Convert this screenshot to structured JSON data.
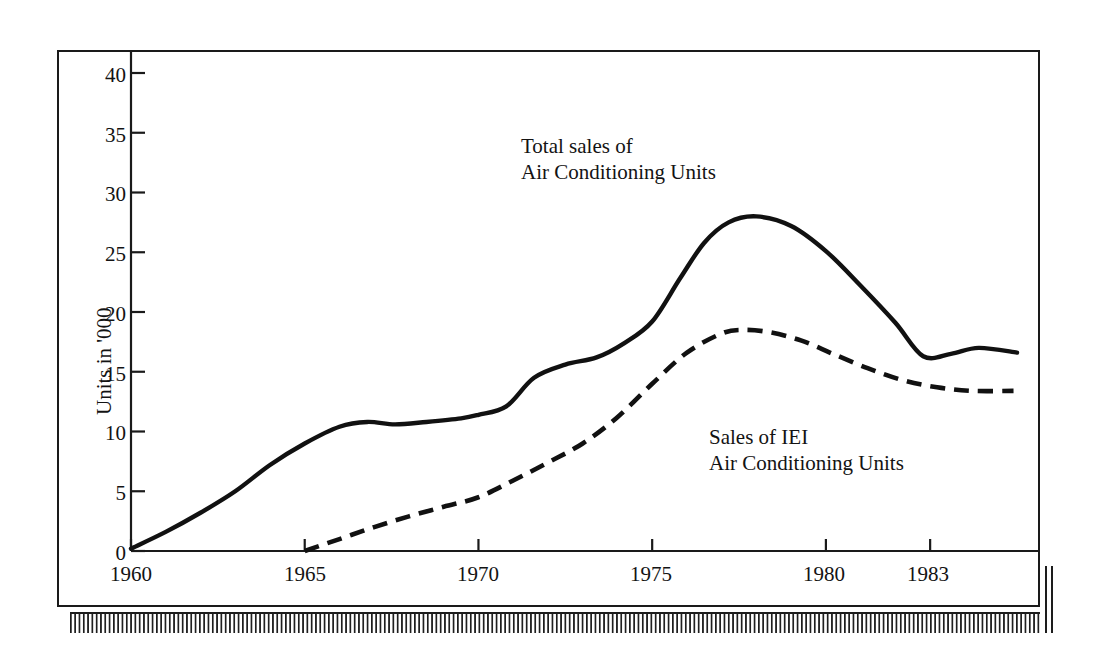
{
  "figure": {
    "background_color": "#ffffff",
    "ink_color": "#131313"
  },
  "axis": {
    "y_title": "Units in '000",
    "y_ticks": [
      "0",
      "5",
      "10",
      "15",
      "20",
      "25",
      "30",
      "35",
      "40"
    ],
    "y_tick_values": [
      0,
      5,
      10,
      15,
      20,
      25,
      30,
      35,
      40
    ],
    "x_ticks": [
      "1960",
      "1965",
      "1970",
      "1975",
      "1980",
      "1983"
    ],
    "x_tick_values": [
      1960,
      1965,
      1970,
      1975,
      1980,
      1983
    ]
  },
  "annotations": {
    "total_sales": {
      "line1": "Total sales of",
      "line2": "Air Conditioning Units"
    },
    "iei_sales": {
      "line1": "Sales of IEI",
      "line2": "Air Conditioning Units"
    }
  },
  "chart_data": {
    "type": "line",
    "title": "",
    "subtitle": "",
    "xlabel": "",
    "ylabel": "Units in '000",
    "xlim": [
      1960,
      1985.5
    ],
    "ylim": [
      0,
      42
    ],
    "grid": false,
    "legend_position": "inline-annotation",
    "x_tick_labels": [
      "1960",
      "1965",
      "1970",
      "1975",
      "1980",
      "1983"
    ],
    "y_tick_labels": [
      "0",
      "5",
      "10",
      "15",
      "20",
      "25",
      "30",
      "35",
      "40"
    ],
    "series": [
      {
        "name": "Total sales of Air Conditioning Units",
        "style": "solid",
        "color": "#111111",
        "x": [
          1960,
          1961,
          1962,
          1963,
          1964,
          1965,
          1966,
          1966.8,
          1967.6,
          1968.5,
          1969.5,
          1970,
          1970.8,
          1971.6,
          1972.5,
          1973.4,
          1974.2,
          1975,
          1975.8,
          1976.5,
          1977.2,
          1978,
          1979,
          1980,
          1981,
          1982,
          1982.8,
          1983.6,
          1984.4,
          1985.5
        ],
        "y": [
          0.2,
          1.6,
          3.2,
          5.0,
          7.2,
          9.0,
          10.4,
          10.8,
          10.6,
          10.8,
          11.1,
          11.4,
          12.1,
          14.5,
          15.6,
          16.2,
          17.4,
          19.2,
          22.8,
          25.8,
          27.5,
          28.0,
          27.2,
          25.1,
          22.2,
          19.1,
          16.3,
          16.5,
          17.0,
          16.6
        ]
      },
      {
        "name": "Sales of IEI Air Conditioning Units",
        "style": "dashed",
        "color": "#111111",
        "x": [
          1965,
          1966,
          1967,
          1968,
          1969,
          1970,
          1971,
          1972,
          1973,
          1974,
          1975,
          1976,
          1977,
          1977.6,
          1978.4,
          1979.3,
          1980.2,
          1981.2,
          1982.2,
          1983.2,
          1984.2,
          1985.4
        ],
        "y": [
          0.0,
          1.0,
          2.0,
          2.9,
          3.7,
          4.5,
          5.9,
          7.4,
          9.0,
          11.2,
          14.0,
          16.6,
          18.2,
          18.5,
          18.3,
          17.6,
          16.5,
          15.3,
          14.3,
          13.7,
          13.4,
          13.4
        ]
      }
    ]
  }
}
